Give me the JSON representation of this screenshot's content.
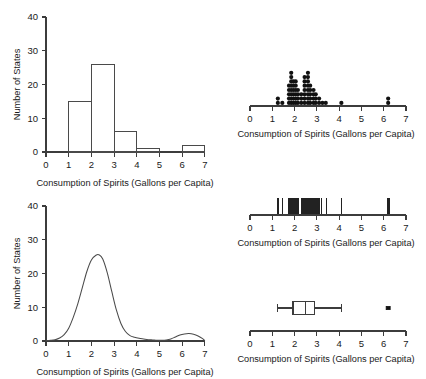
{
  "figure": {
    "width": 426,
    "height": 379,
    "background": "#ffffff",
    "line_color": "#4a4a4a",
    "mark_color": "#111111"
  },
  "common": {
    "xlabel": "Consumption of Spirits (Gallons per Capita)",
    "ylabel": "Number of States",
    "x_ticks": [
      0,
      1,
      2,
      3,
      4,
      5,
      6,
      7
    ],
    "y_ticks": [
      0,
      10,
      20,
      30,
      40
    ],
    "xlim": [
      0,
      7
    ],
    "ylim": [
      0,
      40
    ]
  },
  "chart_data": [
    {
      "id": "histogram",
      "type": "bar",
      "title": "",
      "xlabel": "Consumption of Spirits (Gallons per Capita)",
      "ylabel": "Number of States",
      "xlim": [
        0,
        7
      ],
      "ylim": [
        0,
        40
      ],
      "x_ticks": [
        0,
        1,
        2,
        3,
        4,
        5,
        6,
        7
      ],
      "y_ticks": [
        0,
        10,
        20,
        30,
        40
      ],
      "grid": false,
      "legend": "none",
      "bin_width": 1,
      "bin_edges": [
        0,
        1,
        2,
        3,
        4,
        5,
        6,
        7
      ],
      "categories": [
        "0-1",
        "1-2",
        "2-3",
        "3-4",
        "4-5",
        "5-6",
        "6-7"
      ],
      "values": [
        0,
        15,
        26,
        6,
        1,
        0,
        2
      ]
    },
    {
      "id": "dotplot",
      "type": "scatter",
      "title": "",
      "xlabel": "Consumption of Spirits (Gallons per Capita)",
      "ylabel": "",
      "xlim": [
        0,
        7
      ],
      "x_ticks": [
        0,
        1,
        2,
        3,
        4,
        5,
        6,
        7
      ],
      "grid": false,
      "legend": "none",
      "stacks": [
        {
          "x": 1.25,
          "count": 2
        },
        {
          "x": 1.45,
          "count": 1
        },
        {
          "x": 1.75,
          "count": 5
        },
        {
          "x": 1.85,
          "count": 8
        },
        {
          "x": 1.95,
          "count": 6
        },
        {
          "x": 2.05,
          "count": 6
        },
        {
          "x": 2.15,
          "count": 4
        },
        {
          "x": 2.3,
          "count": 3
        },
        {
          "x": 2.45,
          "count": 7
        },
        {
          "x": 2.6,
          "count": 8
        },
        {
          "x": 2.7,
          "count": 5
        },
        {
          "x": 2.85,
          "count": 4
        },
        {
          "x": 2.95,
          "count": 3
        },
        {
          "x": 3.1,
          "count": 2
        },
        {
          "x": 3.25,
          "count": 1
        },
        {
          "x": 3.4,
          "count": 1
        },
        {
          "x": 4.1,
          "count": 1
        },
        {
          "x": 6.2,
          "count": 2
        }
      ]
    },
    {
      "id": "density",
      "type": "line",
      "title": "",
      "xlabel": "Consumption of Spirits (Gallons per Capita)",
      "ylabel": "Number of States",
      "xlim": [
        0,
        7
      ],
      "ylim": [
        0,
        40
      ],
      "x_ticks": [
        0,
        1,
        2,
        3,
        4,
        5,
        6,
        7
      ],
      "y_ticks": [
        0,
        10,
        20,
        30,
        40
      ],
      "grid": false,
      "legend": "none",
      "peak_x": 2.35,
      "peak_y": 25.5,
      "secondary_peak_x": 6.2,
      "secondary_peak_y": 2.2,
      "x": [
        0.0,
        0.2,
        0.4,
        0.6,
        0.8,
        1.0,
        1.2,
        1.4,
        1.6,
        1.8,
        2.0,
        2.2,
        2.35,
        2.5,
        2.7,
        2.9,
        3.1,
        3.3,
        3.5,
        3.7,
        3.9,
        4.1,
        4.3,
        4.5,
        4.7,
        4.9,
        5.1,
        5.3,
        5.5,
        5.7,
        5.9,
        6.1,
        6.3,
        6.5,
        6.7,
        6.9,
        7.0
      ],
      "y": [
        0.1,
        0.2,
        0.4,
        0.9,
        1.9,
        3.8,
        7.0,
        11.0,
        15.8,
        20.6,
        24.0,
        25.4,
        25.5,
        24.3,
        20.2,
        14.6,
        9.2,
        5.2,
        2.8,
        1.6,
        1.1,
        0.8,
        0.6,
        0.4,
        0.3,
        0.2,
        0.2,
        0.3,
        0.6,
        1.2,
        1.8,
        2.1,
        2.2,
        2.0,
        1.5,
        0.7,
        0.1
      ]
    },
    {
      "id": "rugplot",
      "type": "scatter",
      "title": "",
      "xlabel": "Consumption of Spirits (Gallons per Capita)",
      "ylabel": "",
      "xlim": [
        0,
        7
      ],
      "x_ticks": [
        0,
        1,
        2,
        3,
        4,
        5,
        6,
        7
      ],
      "grid": false,
      "legend": "none",
      "values": [
        1.23,
        1.27,
        1.45,
        1.72,
        1.76,
        1.8,
        1.83,
        1.86,
        1.88,
        1.9,
        1.92,
        1.95,
        1.97,
        2.0,
        2.03,
        2.06,
        2.1,
        2.14,
        2.18,
        2.3,
        2.34,
        2.38,
        2.42,
        2.45,
        2.48,
        2.5,
        2.53,
        2.56,
        2.58,
        2.6,
        2.63,
        2.66,
        2.7,
        2.74,
        2.78,
        2.84,
        2.88,
        2.92,
        2.96,
        3.05,
        3.12,
        3.22,
        3.42,
        4.1,
        6.18,
        6.24
      ]
    },
    {
      "id": "boxplot",
      "type": "box",
      "title": "",
      "xlabel": "Consumption of Spirits (Gallons per Capita)",
      "ylabel": "",
      "xlim": [
        0,
        7
      ],
      "x_ticks": [
        0,
        1,
        2,
        3,
        4,
        5,
        6,
        7
      ],
      "grid": false,
      "legend": "none",
      "whisker_low": 1.23,
      "q1": 1.93,
      "median": 2.48,
      "q3": 2.9,
      "whisker_high": 4.1,
      "outliers": [
        6.2
      ]
    }
  ]
}
